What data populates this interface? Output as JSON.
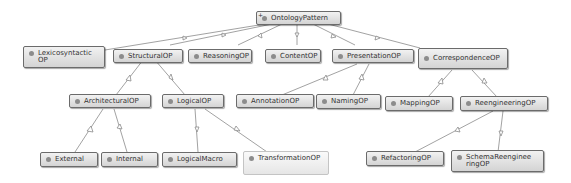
{
  "diagram": {
    "colors": {
      "node_border": "#6b6b6b",
      "node_fill_top": "#f2f2f2",
      "node_fill_bottom": "#d4d4d4",
      "edge": "#8a8a8a",
      "dot": "#8c8c8c"
    },
    "nodes": {
      "root": {
        "label": "OntologyPattern",
        "expand": "+"
      },
      "lexico": {
        "label": "Lexicosyntactic\nOP"
      },
      "structural": {
        "label": "StructuralOP"
      },
      "reasoning": {
        "label": "ReasoningOP"
      },
      "content": {
        "label": "ContentOP"
      },
      "presentation": {
        "label": "PresentationOP"
      },
      "correspondence": {
        "label": "CorrespondenceOP"
      },
      "architectural": {
        "label": "ArchitecturalOP"
      },
      "logical": {
        "label": "LogicalOP"
      },
      "annotation": {
        "label": "AnnotationOP"
      },
      "naming": {
        "label": "NamingOP"
      },
      "mapping": {
        "label": "MappingOP"
      },
      "reengineering": {
        "label": "ReengineeringOP"
      },
      "external": {
        "label": "External"
      },
      "internal": {
        "label": "Internal"
      },
      "logicalmacro": {
        "label": "LogicalMacro"
      },
      "transformation": {
        "label": "TransformationOP"
      },
      "refactoring": {
        "label": "RefactoringOP"
      },
      "schemareeng": {
        "label": "SchemaReenginee\nringOP"
      }
    },
    "edges": [
      [
        "lexico",
        "root"
      ],
      [
        "structural",
        "root"
      ],
      [
        "reasoning",
        "root"
      ],
      [
        "content",
        "root"
      ],
      [
        "presentation",
        "root"
      ],
      [
        "correspondence",
        "root"
      ],
      [
        "architectural",
        "structural"
      ],
      [
        "logical",
        "structural"
      ],
      [
        "annotation",
        "presentation"
      ],
      [
        "naming",
        "presentation"
      ],
      [
        "mapping",
        "correspondence"
      ],
      [
        "reengineering",
        "correspondence"
      ],
      [
        "external",
        "architectural"
      ],
      [
        "internal",
        "architectural"
      ],
      [
        "logicalmacro",
        "logical"
      ],
      [
        "transformation",
        "logical"
      ],
      [
        "refactoring",
        "reengineering"
      ],
      [
        "schemareeng",
        "reengineering"
      ]
    ]
  }
}
